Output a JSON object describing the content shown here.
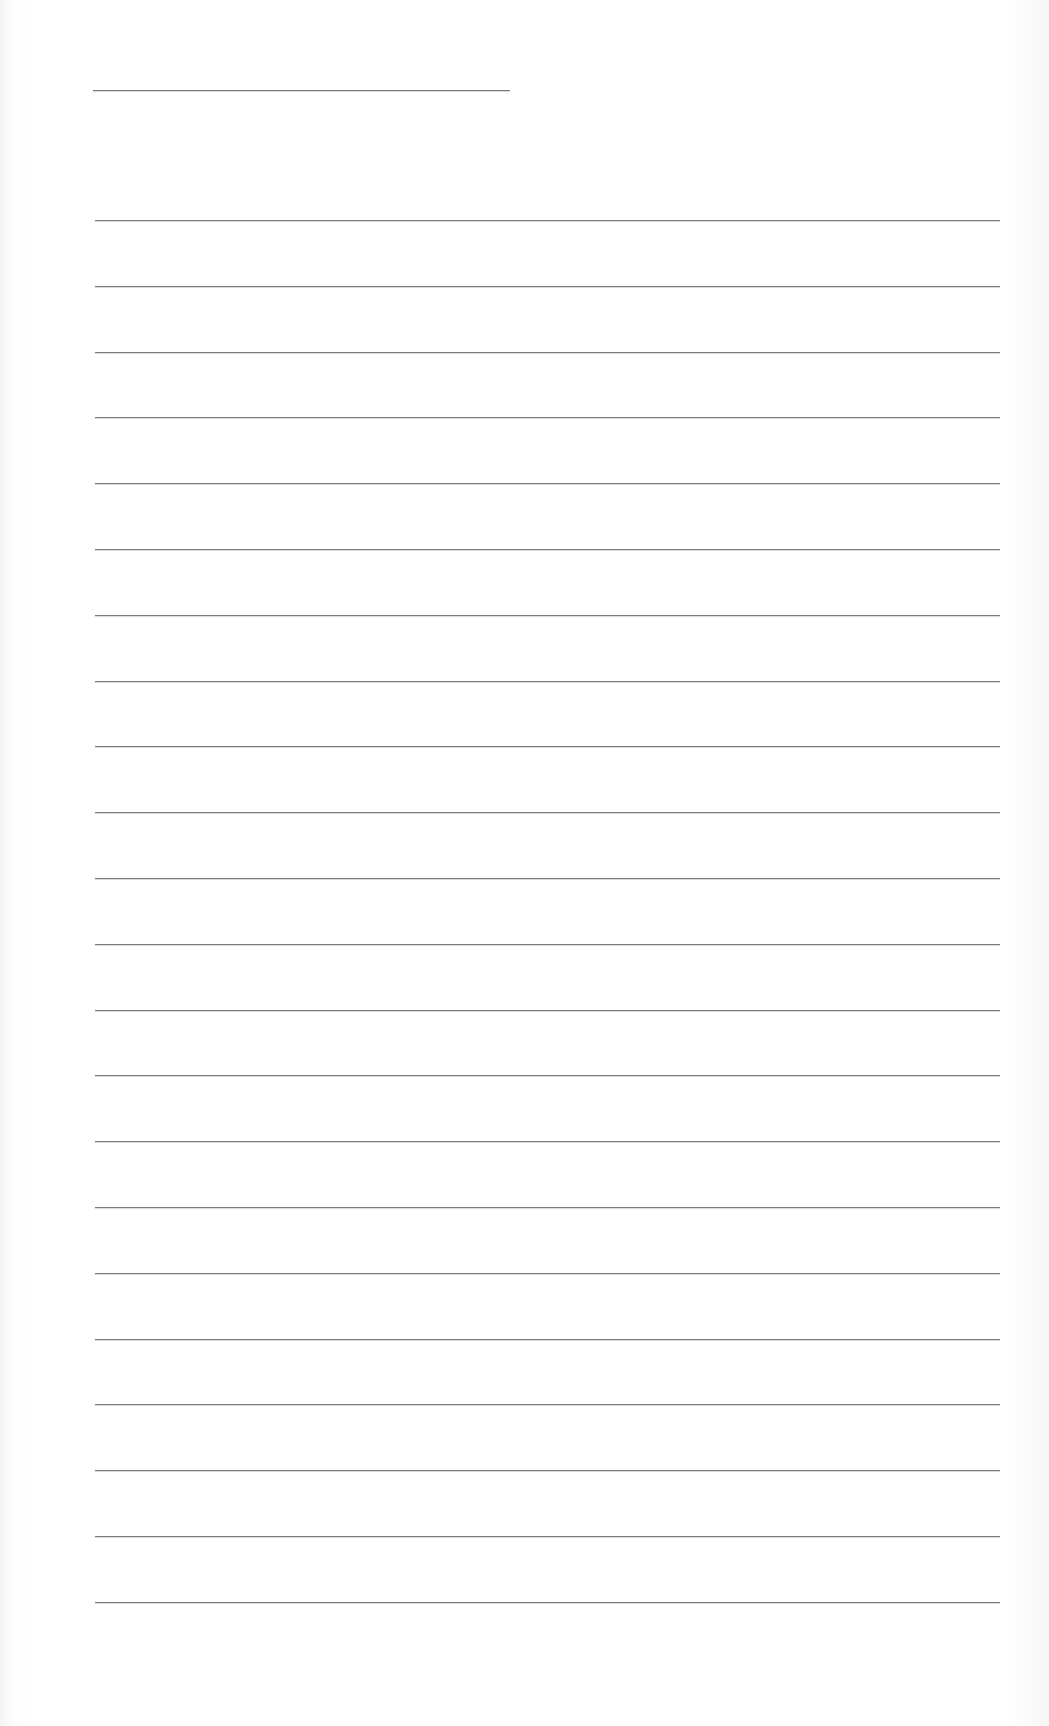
{
  "document": {
    "type": "lined-writing-sheet",
    "header_line": {
      "x": 93,
      "y": 90,
      "width": 417
    },
    "ruled_lines": {
      "count": 22,
      "first_y": 220,
      "spacing": 65.8,
      "x": 95,
      "width": 905
    },
    "colors": {
      "paper": "#ffffff",
      "line": "#7a7a7a"
    }
  }
}
